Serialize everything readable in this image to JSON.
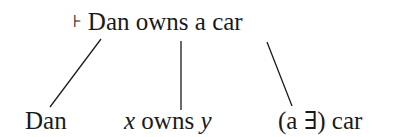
{
  "diagram": {
    "root": {
      "turnstile": "⊦",
      "sentence": "Dan owns a car"
    },
    "constituents": [
      {
        "label": "Dan"
      },
      {
        "var1": "x",
        "middle": " owns ",
        "var2": "y"
      },
      {
        "label": "(a ∃) car"
      }
    ],
    "colors": {
      "ink": "#1a1a1a",
      "background": "#ffffff"
    }
  }
}
